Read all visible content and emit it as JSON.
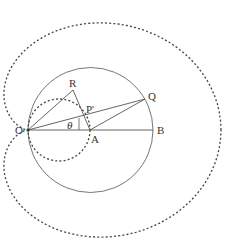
{
  "diagram": {
    "labels": {
      "O": "O",
      "R": "R",
      "Q": "Q",
      "P": "P'",
      "A": "A",
      "B": "B",
      "theta": "θ"
    },
    "colors": {
      "line": "#555555",
      "dashed": "#444444",
      "text": "#333333"
    },
    "points": {
      "O": [
        28,
        130
      ],
      "A": [
        90,
        130
      ],
      "B": [
        153,
        130
      ],
      "R": [
        73,
        90
      ],
      "Q": [
        145,
        99
      ],
      "P": [
        85,
        117
      ]
    }
  }
}
